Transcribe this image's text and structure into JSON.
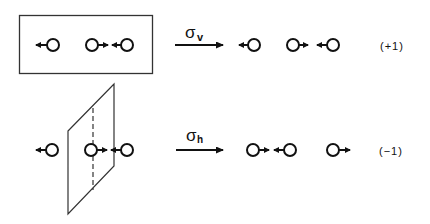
{
  "diagram": {
    "colors": {
      "ink": "#111111",
      "background": "#ffffff",
      "plane": "#333333"
    },
    "rows": [
      {
        "operation": "σ",
        "operation_subscript": "v",
        "element": "vertical-mirror-plane (box, in plane of paper)",
        "before": [
          {
            "atom_x": 53,
            "arrow": "left"
          },
          {
            "atom_x": 92,
            "arrow": "right"
          },
          {
            "atom_x": 127,
            "arrow": "left"
          }
        ],
        "after": [
          {
            "atom_x": 254,
            "arrow": "left"
          },
          {
            "atom_x": 293,
            "arrow": "right"
          },
          {
            "atom_x": 333,
            "arrow": "left"
          }
        ],
        "character": "(+1)"
      },
      {
        "operation": "σ",
        "operation_subscript": "h",
        "element": "horizontal-mirror-plane (perpendicular plane)",
        "before": [
          {
            "atom_x": 52,
            "arrow": "left"
          },
          {
            "atom_x": 91,
            "arrow": "right"
          },
          {
            "atom_x": 127,
            "arrow": "left"
          }
        ],
        "after": [
          {
            "atom_x": 253,
            "arrow": "right"
          },
          {
            "atom_x": 290,
            "arrow": "left"
          },
          {
            "atom_x": 333,
            "arrow": "right"
          }
        ],
        "character": "(−1)"
      }
    ]
  }
}
